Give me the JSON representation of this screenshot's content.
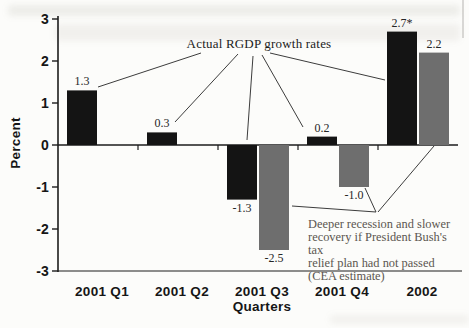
{
  "figure": {
    "ylabel": "Percent",
    "xlabel": "Quarters",
    "annotations": {
      "actual": "Actual RGDP growth rates",
      "counterfactual": "Deeper recession and slower recovery if President Bush's tax relief plan had not passed (CEA estimate)",
      "counterfactual_lines": [
        "Deeper recession and slower",
        "recovery if President Bush's tax",
        "relief plan had not passed",
        "(CEA estimate)"
      ]
    }
  },
  "colors": {
    "actual_bar": "#141414",
    "counterfactual_bar": "#6e6e6e",
    "axis": "#1c1c1c",
    "callout_line": "#3c3c3c",
    "annotation_text": "#5b5650",
    "background": "#fcfcfa"
  },
  "chart_data": {
    "type": "bar",
    "categories": [
      "2001 Q1",
      "2001 Q2",
      "2001 Q3",
      "2001 Q4",
      "2002"
    ],
    "series": [
      {
        "name": "Actual RGDP growth rates",
        "color": "#141414",
        "values": [
          1.3,
          0.3,
          -1.3,
          0.2,
          2.7
        ],
        "value_labels": [
          "1.3",
          "0.3",
          "-1.3",
          "0.2",
          "2.7*"
        ]
      },
      {
        "name": "Deeper recession and slower recovery if President Bush's tax relief plan had not passed (CEA estimate)",
        "color": "#6e6e6e",
        "values": [
          null,
          null,
          -2.5,
          -1.0,
          2.2
        ],
        "value_labels": [
          null,
          null,
          "-2.5",
          "-1.0",
          "2.2"
        ]
      }
    ],
    "title": "",
    "xlabel": "Quarters",
    "ylabel": "Percent",
    "ylim": [
      -3,
      3
    ],
    "yticks": [
      3,
      2,
      1,
      0,
      -1,
      -2,
      -3
    ],
    "grid": false,
    "legend": "none (series identified by callout annotations)"
  }
}
